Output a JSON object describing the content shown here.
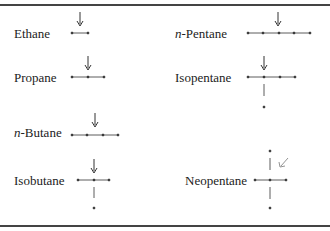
{
  "table": {
    "rows": [
      {
        "left": {
          "name": "Ethane"
        },
        "right": {
          "prefix": "n",
          "name": "-Pentane"
        }
      },
      {
        "left": {
          "name": "Propane"
        },
        "right": {
          "name": "Isopentane"
        }
      },
      {
        "left": {
          "prefix": "n",
          "name": "-Butane"
        },
        "right": null
      },
      {
        "left": {
          "name": "Isobutane"
        },
        "right": {
          "name": "Neopentane"
        }
      }
    ]
  },
  "molecules": {
    "ethane": {
      "label": "Ethane",
      "carbons": 2,
      "arrow": "down"
    },
    "propane": {
      "label": "Propane",
      "carbons": 3,
      "arrow": "down"
    },
    "n_butane": {
      "prefix": "n",
      "label": "-Butane",
      "carbons": 4,
      "arrow": "down"
    },
    "isobutane": {
      "label": "Isobutane",
      "carbons": 4,
      "arrow": "down",
      "branch": "down"
    },
    "n_pentane": {
      "prefix": "n",
      "label": "-Pentane",
      "carbons": 5,
      "arrow": "down"
    },
    "isopentane": {
      "label": "Isopentane",
      "carbons": 5,
      "arrow": "down",
      "branch": "down"
    },
    "neopentane": {
      "label": "Neopentane",
      "carbons": 5,
      "arrow": "diagonal",
      "branch": "cross"
    }
  },
  "colors": {
    "ink": "#222222",
    "rule": "#444444",
    "arrow_neo": "#777777"
  }
}
